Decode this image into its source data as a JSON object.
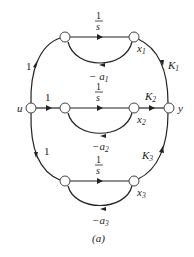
{
  "diagram": {
    "type": "signal-flow-graph",
    "caption": "(a)",
    "nodes": {
      "u": "u",
      "y": "y",
      "x1": "x",
      "x1_sub": "1",
      "x2": "x",
      "x2_sub": "2",
      "x3": "x",
      "x3_sub": "3"
    },
    "edges": {
      "u_to_top": "1",
      "u_to_mid": "1",
      "u_to_bot": "1",
      "top_integrator_num": "1",
      "top_integrator_den": "s",
      "mid_integrator_num": "1",
      "mid_integrator_den": "s",
      "bot_integrator_num": "1",
      "bot_integrator_den": "s",
      "feedback1": "− a",
      "feedback1_sub": "1",
      "feedback2": "−a",
      "feedback2_sub": "2",
      "feedback3": "−a",
      "feedback3_sub": "3",
      "gain1": "K",
      "gain1_sub": "1",
      "gain2": "K",
      "gain2_sub": "2",
      "gain3": "K",
      "gain3_sub": "3"
    }
  }
}
